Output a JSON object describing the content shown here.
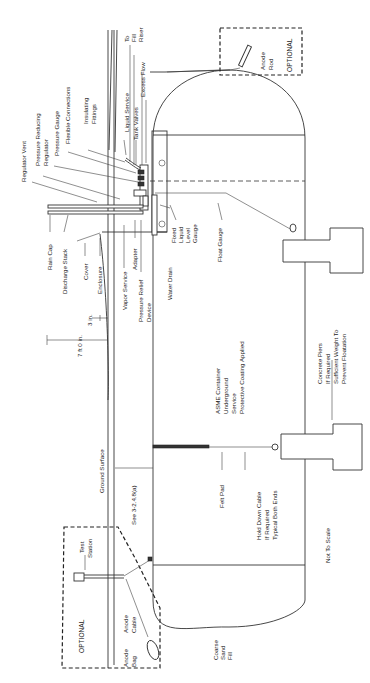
{
  "diagram": {
    "type": "underground-lp-gas-container-installation",
    "orientation": "rotated-90-ccw",
    "labels": {
      "to_fill_riser": [
        "To",
        "Fill",
        "Riser"
      ],
      "excess_flow": "Excess Flow",
      "tank_valves": "Tank Valves",
      "liquid_service": "Liquid Service",
      "insulating_fittings": [
        "Insulating",
        "Fittings"
      ],
      "flexible_connections": "Flexible Connections",
      "pressure_gauge": "Pressure Gauge",
      "pressure_reducing_regulator": [
        "Pressure Reducing",
        "Regulator"
      ],
      "regulator_vent": "Regulator Vent",
      "rain_cap": "Rain Cap",
      "discharge_stack": "Discharge Stack",
      "cover": "Cover",
      "enclosure": "Enclosure",
      "vapor_service": "Vapor Service",
      "adapter": "Adapter",
      "pressure_relief_device": [
        "Pressure Relief",
        "Device"
      ],
      "water_drain": "Water Drain",
      "fixed_liquid_level_gauge": [
        "Fixed",
        "Liquid",
        "Level",
        "Gauge"
      ],
      "float_gauge": "Float Gauge",
      "dim_3in": "3 in.",
      "dim_7ft": "7 ft 0 in.",
      "ground_surface": "Ground Surface",
      "see_ref": "See 3-2.4.8(a)",
      "asme_container": [
        "ASME Container",
        "Underground",
        "Service",
        "Protective Coating Applied"
      ],
      "concrete_piers": [
        "Concrete Piers",
        "If Required",
        "Sufficient Weight To",
        "Prevent Floatation"
      ],
      "felt_pad": "Felt Pad",
      "hold_down_cable": [
        "Hold Down Cable",
        "If Required",
        "Typical Both Ends"
      ],
      "not_to_scale": "Not To Scale",
      "coarse_sand_fill": [
        "Coarse",
        "Sand",
        "Fill"
      ],
      "test_station": [
        "Test",
        "Station"
      ],
      "anode_cable": [
        "Anode",
        "Cable"
      ],
      "anode_bag": [
        "Anode",
        "Bag"
      ],
      "optional_bottom": "OPTIONAL",
      "optional_top": "OPTIONAL",
      "anode_rod": [
        "Anode",
        "Rod"
      ]
    }
  }
}
